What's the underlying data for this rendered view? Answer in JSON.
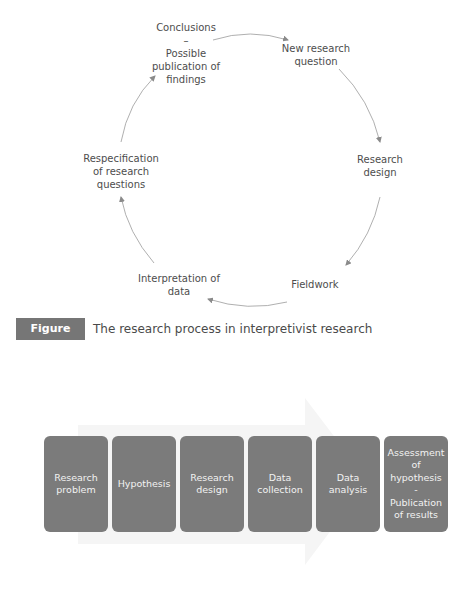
{
  "cycle_diagram": {
    "nodes": [
      {
        "id": "conclusions",
        "lines": [
          "Conclusions",
          "–",
          "Possible",
          "publication of",
          "findings"
        ]
      },
      {
        "id": "new-research-question",
        "lines": [
          "New research",
          "question"
        ]
      },
      {
        "id": "research-design",
        "lines": [
          "Research",
          "design"
        ]
      },
      {
        "id": "fieldwork",
        "lines": [
          "Fieldwork"
        ]
      },
      {
        "id": "interpretation-of-data",
        "lines": [
          "Interpretation of",
          "data"
        ]
      },
      {
        "id": "respecification",
        "lines": [
          "Respecification",
          "of research",
          "questions"
        ]
      }
    ],
    "arrow_color": "#8a8a8a"
  },
  "caption": {
    "label": "Figure 2.3",
    "text": "The research process in interpretivist research",
    "label_bg": "#767676"
  },
  "linear_process": {
    "steps": [
      {
        "lines": [
          "Research",
          "problem"
        ]
      },
      {
        "lines": [
          "Hypothesis"
        ]
      },
      {
        "lines": [
          "Research",
          "design"
        ]
      },
      {
        "lines": [
          "Data",
          "collection"
        ]
      },
      {
        "lines": [
          "Data",
          "analysis"
        ]
      },
      {
        "lines": [
          "Assessment",
          "of",
          "hypothesis",
          "-",
          "Publication",
          "of results"
        ]
      }
    ],
    "box_color": "#7b7b7b",
    "background_arrow_color": "#f4f4f4"
  }
}
